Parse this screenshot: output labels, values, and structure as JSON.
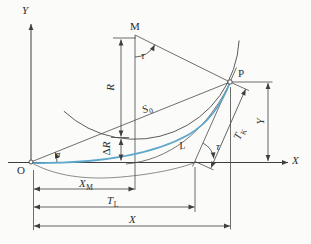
{
  "figure": {
    "colors": {
      "accent_curve": "#5ea7cb",
      "line": "#3f3f3f",
      "background": "#fbfbfa"
    },
    "axes": {
      "x": "X",
      "y": "Y"
    },
    "points": {
      "origin": "O",
      "circle_center": "M",
      "curve_end": "P"
    },
    "angles": {
      "tau": "τ",
      "sigma": "σ"
    },
    "dims": {
      "radius": "R",
      "delta": "Δ",
      "chord": {
        "main": "S",
        "sub": "0"
      },
      "length": "L",
      "xm": {
        "main": "X",
        "sub": "M"
      },
      "tl": {
        "main": "T",
        "sub": "L"
      },
      "x": "X",
      "y": "Y",
      "tk": {
        "main": "T",
        "sub": "K"
      }
    }
  }
}
